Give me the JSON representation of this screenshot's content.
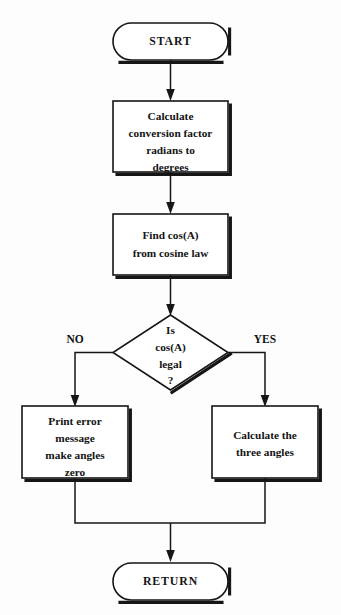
{
  "diagram": {
    "colors": {
      "stroke": "#161616",
      "node_fill": "#ffffff",
      "background": "#fdfdfd",
      "text": "#141414"
    },
    "nodes": {
      "start": {
        "type": "terminal",
        "label": "START"
      },
      "conversion": {
        "type": "process",
        "lines": [
          "Calculate",
          "conversion factor",
          "radians to",
          "degrees"
        ]
      },
      "cosine": {
        "type": "process",
        "lines": [
          "Find cos(A)",
          "from cosine law"
        ]
      },
      "decision": {
        "type": "decision",
        "lines": [
          "Is",
          "cos(A)",
          "legal",
          "?"
        ]
      },
      "error": {
        "type": "process",
        "lines": [
          "Print error",
          "message",
          "make angles",
          "zero"
        ]
      },
      "angles": {
        "type": "process",
        "lines": [
          "Calculate the",
          "three angles"
        ]
      },
      "return": {
        "type": "terminal",
        "label": "RETURN"
      }
    },
    "branch_labels": {
      "no": "NO",
      "yes": "YES"
    }
  }
}
